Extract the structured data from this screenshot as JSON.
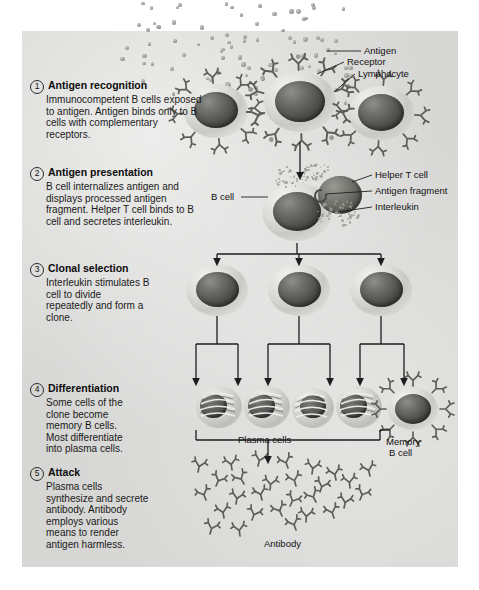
{
  "figure": {
    "panel_color": "#d6d6d4",
    "page_color": "#ffffff"
  },
  "steps": [
    {
      "number": "1",
      "title": "Antigen recognition",
      "body": "Immunocompetent B cells exposed to antigen. Antigen binds only to B cells with complementary receptors."
    },
    {
      "number": "2",
      "title": "Antigen presentation",
      "body": "B cell internalizes antigen and displays processed antigen fragment. Helper T cell binds to B cell and secretes interleukin."
    },
    {
      "number": "3",
      "title": "Clonal selection",
      "body": "Interleukin stimulates B cell to divide repeatedly and form a clone."
    },
    {
      "number": "4",
      "title": "Differentiation",
      "body": "Some cells of the clone become memory B cells. Most differentiate into plasma cells."
    },
    {
      "number": "5",
      "title": "Attack",
      "body": "Plasma cells synthesize and secrete antibody. Antibody employs various means to render antigen harmless."
    }
  ],
  "labels": {
    "antigen": "Antigen",
    "receptor": "Receptor",
    "lymphocyte": "Lymphocyte",
    "b_cell": "B cell",
    "helper_t_cell": "Helper T cell",
    "antigen_fragment": "Antigen fragment",
    "interleukin": "Interleukin",
    "plasma_cells": "Plasma cells",
    "memory_line1": "Memory",
    "memory_line2": "B cell",
    "antibody": "Antibody"
  }
}
